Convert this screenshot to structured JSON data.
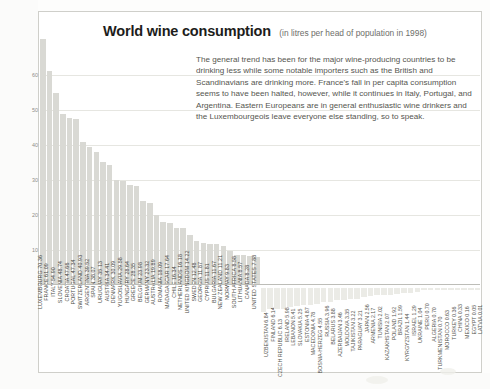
{
  "header": {
    "title": "World wine consumption",
    "subtitle": "(in litres per head of population in 1998)"
  },
  "blurb": {
    "text": "The general trend has been for the major wine-producing countries to be drinking less while some notable importers such as the British and Scandinavians are drinking more. France's fall in per capita consumption seems to have been halted, however, while it continues in Italy, Portugal, and Argentina. Eastern Europeans are in general enthusiastic wine drinkers and the Luxembourgeois leave everyone else standing, so to speak."
  },
  "chart_data": {
    "type": "bar",
    "title": "World wine consumption",
    "subtitle": "(in litres per head of population in 1998)",
    "xlabel": "",
    "ylabel": "litres per head of population",
    "ylim": [
      0,
      72
    ],
    "yticks": [
      10,
      20,
      30,
      40,
      50,
      60
    ],
    "grid": true,
    "legend": "none",
    "orientation": "vertical",
    "units": "litres",
    "year": 1998,
    "categories": [
      "LUXEMBOURG",
      "FRANCE",
      "ITALY",
      "SLOVENIA",
      "CROATIA",
      "PORTUGAL",
      "SWITZERLAND",
      "ARGENTINA",
      "SPAIN",
      "URUGUAY",
      "AUSTRIA",
      "DENMARK",
      "YUGOSLAVIA",
      "HUNGARY",
      "GREECE",
      "BELGIUM",
      "GERMANY",
      "AUSTRALIA",
      "ROMANIA",
      "MADAGASCAR",
      "CHILE",
      "NETHERLANDS",
      "UNITED KINGDOM",
      "SWEDEN",
      "GEORGIA",
      "CYPRUS",
      "BULGARIA",
      "NEW ZEALAND",
      "NORWAY",
      "SOUTH AFRICA",
      "LITHUANIA",
      "CANADA",
      "UNITED STATES",
      "UZBEKISTAN",
      "FINLAND",
      "CZECH REPUBLIC",
      "IRELAND",
      "LEBANON",
      "SLOVAKIA",
      "ESTONIA",
      "MACEDONIA",
      "BOSNIA-HERZEG",
      "RUSSIA",
      "BELARUS",
      "AZERBAIJAN",
      "MOLDOVA",
      "TAJIKISTAN",
      "PARAGUAY",
      "JAPAN",
      "ARMENIA",
      "TUNISIA",
      "KAZAKHSTAN",
      "POLAND",
      "BRAZIL",
      "KYRGYZSTAN",
      "ISRAEL",
      "UKRAINE",
      "PERU",
      "ALGERIA",
      "TURKMENISTAN",
      "MOROCCO",
      "TURKEY",
      "CHINA",
      "MEXICO",
      "EGYPT",
      "LATVIA"
    ],
    "values": [
      70.36,
      61.09,
      54.9,
      48.74,
      47.66,
      47.34,
      40.93,
      39.52,
      38.07,
      35.13,
      34.41,
      30.09,
      29.58,
      28.64,
      28.35,
      23.98,
      23.32,
      19.89,
      18.09,
      17.64,
      16.34,
      16.18,
      14.22,
      12.48,
      11.87,
      11.81,
      11.67,
      11.21,
      9.83,
      8.58,
      8.57,
      8.28,
      7.88,
      6.84,
      6.14,
      6.13,
      5.98,
      5.41,
      5.25,
      4.87,
      4.78,
      4.55,
      3.96,
      3.88,
      3.46,
      3.35,
      3.22,
      3.21,
      2.56,
      2.17,
      2.02,
      2.07,
      1.92,
      1.59,
      1.44,
      1.29,
      1.04,
      0.7,
      0.7,
      0.7,
      0.63,
      0.36,
      0.33,
      0.16,
      0.05,
      0.01
    ],
    "labels": [
      "LUXEMBOURG 70.36",
      "FRANCE 61.09",
      "ITALY 54.90",
      "SLOVENIA 48.74",
      "CROATIA 47.66",
      "PORTUGAL 47.34",
      "SWITZERLAND 40.93",
      "ARGENTINA 39.52",
      "SPAIN 38.07",
      "URUGUAY 35.13",
      "AUSTRIA 34.41",
      "DENMARK 30.09",
      "YUGOSLAVIA 29.58",
      "HUNGARY 28.64",
      "GREECE 28.35",
      "BELGIUM 23.98",
      "GERMANY 23.32",
      "AUSTRALIA 19.89",
      "ROMANIA 18.09",
      "MADAGASCAR 17.64",
      "CHILE 16.34",
      "NETHERLANDS 16.18",
      "UNITED KINGDOM 14.22",
      "SWEDEN 12.48",
      "GEORGIA 11.87",
      "CYPRUS 11.81",
      "BULGARIA 11.67",
      "NEW ZEALAND 11.21",
      "NORWAY 9.83",
      "SOUTH AFRICA 8.58",
      "LITHUANIA 8.57",
      "CANADA 8.28",
      "UNITED STATES 7.88"
    ],
    "small_labels": [
      "UZBEKISTAN 6.84",
      "FINLAND 6.14",
      "CZECH REPUBLIC 6.13",
      "IRELAND 5.98",
      "LEBANON 5.41",
      "SLOVAKIA 5.25",
      "ESTONIA 4.87",
      "MACEDONIA 4.78",
      "BOSNIA-HERZEG 4.55",
      "RUSSIA 3.96",
      "BELARUS 3.88",
      "AZERBAIJAN 3.46",
      "MOLDOVA 3.35",
      "TAJIKISTAN 3.22",
      "PARAGUAY 3.21",
      "JAPAN 2.56",
      "ARMENIA 2.17",
      "TUNISIA 2.02",
      "KAZAKHSTAN 2.07",
      "POLAND 1.92",
      "BRAZIL 1.59",
      "KYRGYZSTAN 1.44",
      "ISRAEL 1.29",
      "UKRAINE 1.04",
      "PERU 0.70",
      "ALGERIA 0.70",
      "TURKMENISTAN 0.70",
      "MOROCCO 0.63",
      "TURKEY 0.36",
      "CHINA 0.33",
      "MEXICO 0.16",
      "EGYPT 0.05",
      "LATVIA 0.01"
    ]
  },
  "colors": {
    "bar": "#d9d9d4",
    "small_bar": "#ebebe6",
    "grid": "#e6e6e1",
    "text": "#4a4a46",
    "title": "#1d1d1b"
  }
}
